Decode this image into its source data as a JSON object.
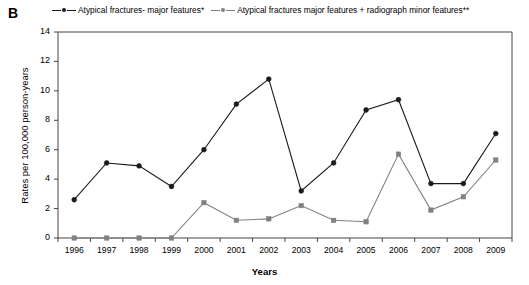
{
  "panel": {
    "label": "B"
  },
  "legend": {
    "position": "top",
    "entries": [
      {
        "name": "Atypical fractures- major features*",
        "color": "#1a1a1a"
      },
      {
        "name": "Atypical fractures major features + radiograph minor features**",
        "color": "#808080"
      }
    ]
  },
  "chart_data": {
    "type": "line",
    "title": "",
    "subtitle": "",
    "xlabel": "Years",
    "ylabel": "Rates per 100,000 person-years",
    "categories": [
      "1996",
      "1997",
      "1998",
      "1999",
      "2000",
      "2001",
      "2002",
      "2003",
      "2004",
      "2005",
      "2006",
      "2007",
      "2008",
      "2009"
    ],
    "x": [
      1996,
      1997,
      1998,
      1999,
      2000,
      2001,
      2002,
      2003,
      2004,
      2005,
      2006,
      2007,
      2008,
      2009
    ],
    "series": [
      {
        "name": "Atypical fractures- major features*",
        "color": "#1a1a1a",
        "marker": "diamond",
        "values": [
          2.6,
          5.1,
          4.9,
          3.5,
          6.0,
          9.1,
          10.8,
          3.2,
          5.1,
          8.7,
          9.4,
          3.7,
          3.7,
          7.1
        ]
      },
      {
        "name": "Atypical fractures major features + radiograph minor features**",
        "color": "#808080",
        "marker": "square",
        "values": [
          0.0,
          0.0,
          0.0,
          0.0,
          2.4,
          1.2,
          1.3,
          2.2,
          1.2,
          1.1,
          5.7,
          1.9,
          2.8,
          5.3
        ]
      }
    ],
    "ylim": [
      0,
      14
    ],
    "yticks": [
      0,
      2,
      4,
      6,
      8,
      10,
      12,
      14
    ],
    "ytick_labels": [
      "0",
      "2",
      "4",
      "6",
      "8",
      "10",
      "12",
      "14"
    ],
    "grid": false,
    "legend_position": "top"
  }
}
